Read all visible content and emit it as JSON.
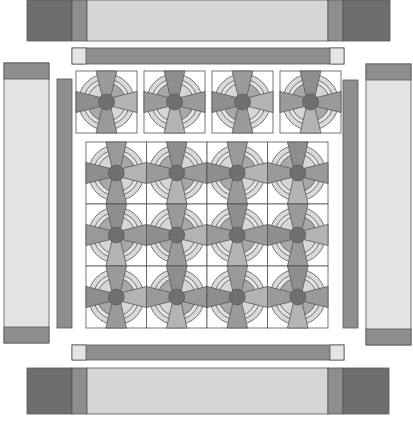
{
  "diagram": {
    "type": "quilt-assembly-layout",
    "canvas": {
      "width": 413,
      "height": 422
    },
    "colors": {
      "dark": "#6e6e6e",
      "medium": "#8e8e8e",
      "medium_light": "#a8a8a8",
      "light": "#d6d6d6",
      "very_light": "#e4e4e4",
      "center": "#707070",
      "blade": "#9a9a9a",
      "blade_alt": "#b4b4b4",
      "ring_outer": "#d9d9d9",
      "background": "#ffffff",
      "outline": "#555555"
    },
    "borders": {
      "top": {
        "x": 27,
        "y": 0,
        "w": 363,
        "h": 41,
        "segments": [
          {
            "x": 27,
            "w": 45,
            "shade": "dark"
          },
          {
            "x": 72,
            "w": 15,
            "shade": "medium"
          },
          {
            "x": 87,
            "w": 241,
            "shade": "light"
          },
          {
            "x": 328,
            "w": 15,
            "shade": "medium"
          },
          {
            "x": 343,
            "w": 47,
            "shade": "dark"
          }
        ]
      },
      "bottom": {
        "x": 27,
        "y": 368,
        "w": 363,
        "h": 46,
        "segments": [
          {
            "x": 27,
            "w": 45,
            "shade": "dark"
          },
          {
            "x": 72,
            "w": 15,
            "shade": "medium"
          },
          {
            "x": 87,
            "w": 241,
            "shade": "light"
          },
          {
            "x": 328,
            "w": 15,
            "shade": "medium"
          },
          {
            "x": 343,
            "w": 46,
            "shade": "dark"
          }
        ]
      },
      "left": {
        "x": 4,
        "y": 63,
        "w": 45,
        "h": 280,
        "cap_h": 16
      },
      "right": {
        "x": 366,
        "y": 64,
        "w": 45,
        "h": 281,
        "cap_h": 16
      }
    },
    "sashing": {
      "top": {
        "x": 72,
        "y": 48,
        "w": 272,
        "h": 16,
        "end_w": 14
      },
      "bottom": {
        "x": 72,
        "y": 345,
        "w": 272,
        "h": 15,
        "end_w": 14
      },
      "left": {
        "x": 57,
        "y": 79,
        "w": 15,
        "h": 249
      },
      "right": {
        "x": 343,
        "y": 80,
        "w": 15,
        "h": 248
      }
    },
    "top_row_blocks": {
      "count": 4,
      "y": 71,
      "size": 61,
      "xs": [
        76,
        144,
        212,
        280
      ]
    },
    "center_grid": {
      "x": 86,
      "y": 142,
      "cols": 4,
      "rows": 3,
      "cell_w": 60.5,
      "cell_h": 62
    }
  }
}
